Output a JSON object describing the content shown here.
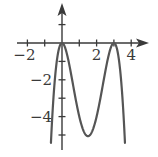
{
  "chart_data": {
    "type": "line",
    "title": "",
    "xlabel": "",
    "ylabel": "",
    "function": "f(x) = -x^2 (x - 3)^2",
    "x_domain": [
      -0.64,
      3.64
    ],
    "xlim": [
      -2.6,
      4.9
    ],
    "ylim": [
      -5.8,
      2.1
    ],
    "grid": false,
    "legend": null,
    "x_ticks": [
      -2,
      -1,
      0,
      1,
      2,
      3,
      4
    ],
    "x_tick_labels": [
      {
        "value": -2,
        "label": "−2"
      },
      {
        "value": 2,
        "label": "2"
      },
      {
        "value": 4,
        "label": "4"
      }
    ],
    "y_ticks": [
      1,
      0,
      -1,
      -2,
      -3,
      -4,
      -5
    ],
    "y_tick_labels": [
      {
        "value": -2,
        "label": "−2"
      },
      {
        "value": -4,
        "label": "−4"
      }
    ],
    "key_points": [
      {
        "x": 0,
        "y": 0,
        "note": "local maximum (touches x-axis)"
      },
      {
        "x": 1.5,
        "y": -5.06,
        "note": "local minimum"
      },
      {
        "x": 3,
        "y": 0,
        "note": "local maximum (touches x-axis)"
      }
    ],
    "series": [
      {
        "name": "f(x)",
        "color": "#555555",
        "x": [
          -0.64,
          -0.5,
          -0.25,
          0,
          0.25,
          0.5,
          0.75,
          1,
          1.25,
          1.5,
          1.75,
          2,
          2.25,
          2.5,
          2.75,
          3,
          3.25,
          3.5,
          3.64
        ],
        "y": [
          -5.52,
          -3.06,
          -0.66,
          0,
          -0.47,
          -1.56,
          -2.85,
          -4.0,
          -4.73,
          -5.06,
          -4.79,
          -4.0,
          -2.85,
          -1.56,
          -0.47,
          0,
          -0.66,
          -3.06,
          -5.52
        ]
      }
    ]
  },
  "colors": {
    "axis": "#3a3a3a",
    "curve": "#555555",
    "background": "#ffffff"
  }
}
